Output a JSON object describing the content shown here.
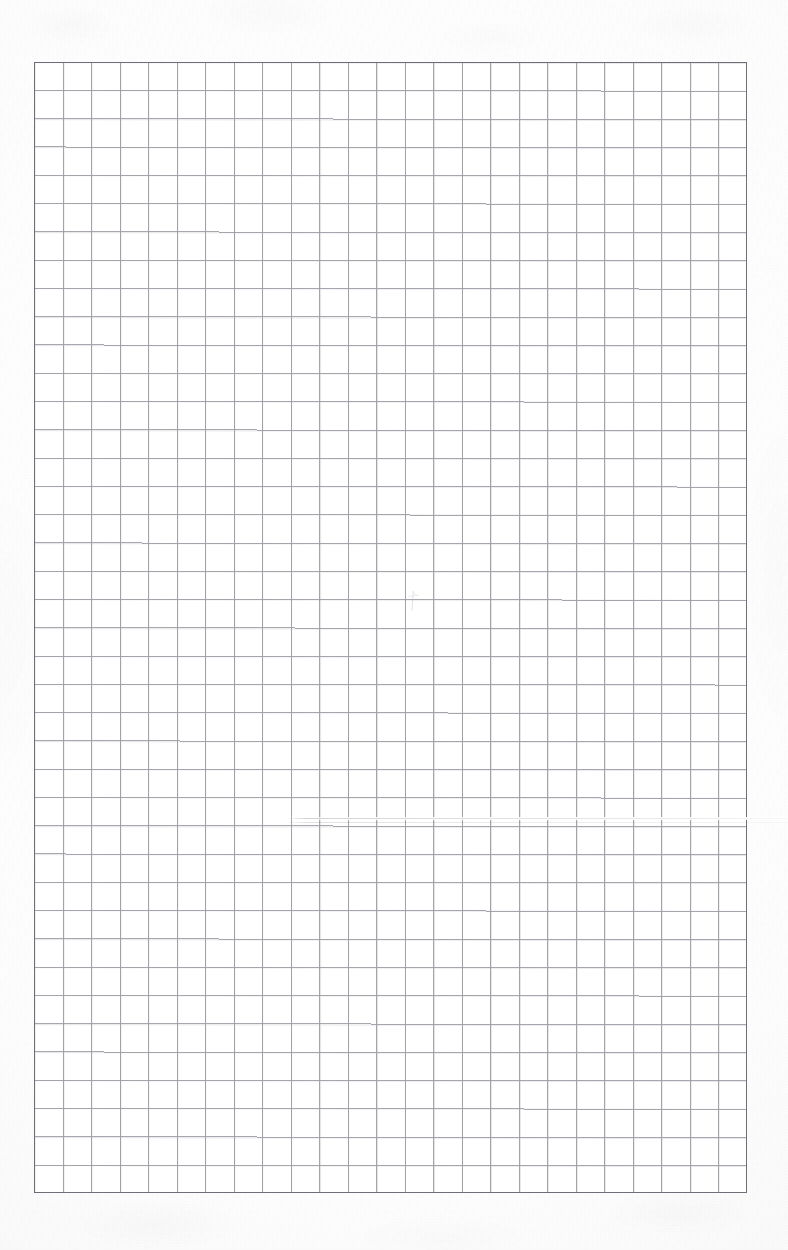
{
  "document": {
    "kind": "scanned-graph-paper",
    "title": "Blank quadrille graph paper scan",
    "page_width": 788,
    "page_height": 1250,
    "content_text": "",
    "handwriting_text": ""
  },
  "background": {
    "page_color": "#fdfdfd",
    "paper_color": "#ffffff",
    "margin_tone": "#f6f6f7"
  },
  "grid": {
    "left": 34,
    "top": 62,
    "width": 713,
    "height": 1131,
    "columns": 25,
    "rows": 40,
    "cell_width": 28.52,
    "cell_height": 28.28,
    "line_color": "#9a9aa2",
    "line_width": 1,
    "border_color": "#6e6e77",
    "border_width": 1,
    "has_heavy_major_lines": false
  },
  "artifacts": {
    "pencil_mark": {
      "label": "faint pencil tick",
      "x": 407,
      "y": 590,
      "width": 14,
      "height": 22,
      "color": "#b8b8bf"
    },
    "scan_streak": {
      "label": "horizontal scanner streak",
      "x": 286,
      "y": 817,
      "width": 502,
      "height": 8,
      "dark_color": "#7a7a82",
      "light_color": "#ffffff"
    }
  }
}
